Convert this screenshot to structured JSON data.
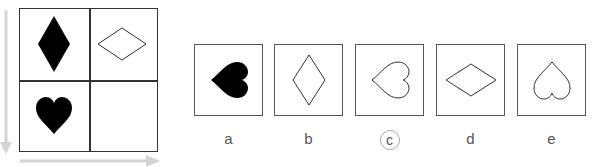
{
  "puzzle": {
    "grid": {
      "cells": [
        {
          "position": "top-left",
          "shape": "diamond",
          "fill": "black",
          "orientation": "vertical"
        },
        {
          "position": "top-right",
          "shape": "diamond",
          "fill": "outline",
          "orientation": "horizontal"
        },
        {
          "position": "bottom-left",
          "shape": "heart",
          "fill": "black",
          "orientation": "upright"
        },
        {
          "position": "bottom-right",
          "shape": "empty",
          "fill": "none",
          "orientation": "none"
        }
      ],
      "arrows": {
        "vertical": "down-arrow",
        "horizontal": "right-arrow"
      }
    },
    "options": [
      {
        "label": "a",
        "shape": "heart",
        "fill": "black",
        "orientation": "rotated-left",
        "selected": false
      },
      {
        "label": "b",
        "shape": "diamond",
        "fill": "outline",
        "orientation": "vertical",
        "selected": false
      },
      {
        "label": "c",
        "shape": "heart",
        "fill": "outline",
        "orientation": "rotated-left",
        "selected": true
      },
      {
        "label": "d",
        "shape": "diamond",
        "fill": "outline",
        "orientation": "horizontal",
        "selected": false
      },
      {
        "label": "e",
        "shape": "heart",
        "fill": "outline",
        "orientation": "inverted",
        "selected": false
      }
    ],
    "colors": {
      "stroke": "#333333",
      "fill": "#000000",
      "arrow": "#d0d0d0",
      "label": "#555555"
    }
  }
}
